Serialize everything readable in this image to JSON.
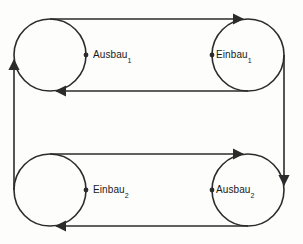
{
  "diagram": {
    "type": "cycle-flow-diagram",
    "background_color": "#fdfdfc",
    "stroke_color": "#2b2b2b",
    "nodes": [
      {
        "id": "ausbau1",
        "name": "Ausbau",
        "subscript": "1",
        "position": "top-left",
        "center": {
          "x": 50,
          "y": 55
        },
        "radius": 36,
        "marker_dot": {
          "x": 86,
          "y": 55
        },
        "label_side": "right"
      },
      {
        "id": "einbau1",
        "name": "Einbau",
        "subscript": "1",
        "position": "top-right",
        "center": {
          "x": 248,
          "y": 55
        },
        "radius": 36,
        "marker_dot": {
          "x": 212,
          "y": 55
        },
        "label_side": "right"
      },
      {
        "id": "einbau2",
        "name": "Einbau",
        "subscript": "2",
        "position": "bottom-left",
        "center": {
          "x": 50,
          "y": 190
        },
        "radius": 36,
        "marker_dot": {
          "x": 86,
          "y": 190
        },
        "label_side": "right"
      },
      {
        "id": "ausbau2",
        "name": "Ausbau",
        "subscript": "2",
        "position": "bottom-right",
        "center": {
          "x": 248,
          "y": 190
        },
        "radius": 36,
        "marker_dot": {
          "x": 212,
          "y": 190
        },
        "label_side": "right"
      }
    ],
    "edges": [
      {
        "id": "top-outer",
        "from": "ausbau1",
        "to": "einbau1",
        "direction": "right",
        "y": 19
      },
      {
        "id": "top-inner",
        "from": "einbau1",
        "to": "ausbau1",
        "direction": "left",
        "y": 91
      },
      {
        "id": "right-vertical",
        "from": "einbau1",
        "to": "ausbau2",
        "direction": "down",
        "x": 284
      },
      {
        "id": "bottom-outer",
        "from": "einbau2",
        "to": "ausbau2",
        "direction": "right",
        "y": 154
      },
      {
        "id": "bottom-inner",
        "from": "ausbau2",
        "to": "einbau2",
        "direction": "left",
        "y": 226
      },
      {
        "id": "left-vertical",
        "from": "einbau2",
        "to": "ausbau1",
        "direction": "up",
        "x": 14
      }
    ]
  }
}
